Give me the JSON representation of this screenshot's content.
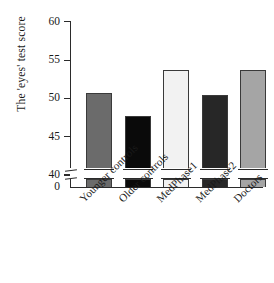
{
  "chart_data": {
    "type": "bar",
    "title": "",
    "subtitle": "",
    "xlabel": "",
    "ylabel": "The 'eyes' test score",
    "categories": [
      "Younger controls",
      "Older controls",
      "MedPhase1",
      "MedPhase2",
      "Doctors"
    ],
    "values": [
      50.7,
      47.7,
      53.7,
      50.4,
      53.7
    ],
    "series": [
      {
        "name": "The 'eyes' test score",
        "values": [
          50.7,
          47.7,
          53.7,
          50.4,
          53.7
        ]
      }
    ],
    "bar_colors": [
      "#6b6b6b",
      "#0a0a0a",
      "#f2f2f2",
      "#272727",
      "#a5a5a5"
    ],
    "bar_outline_color": "#3a3a3a",
    "ylim": [
      40,
      60
    ],
    "y_ticks": [
      "40",
      "45",
      "50",
      "55",
      "60"
    ],
    "y_tick_values": [
      40,
      45,
      50,
      55,
      60
    ],
    "y_axis_break": true,
    "y_break_label": "0",
    "grid": false,
    "legend": "none",
    "axis_color": "#2b2b2b",
    "background": "#ffffff"
  },
  "axis": {
    "y_title": "The 'eyes' test score",
    "zero_label": "0"
  }
}
